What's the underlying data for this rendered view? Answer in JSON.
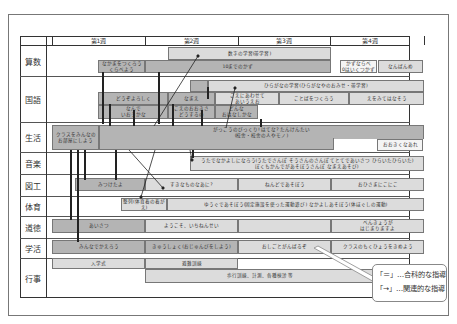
{
  "weeks": [
    "第1週",
    "第2週",
    "第3週",
    "第4週"
  ],
  "subjects": [
    "算数",
    "国語",
    "生活",
    "音楽",
    "図工",
    "体育",
    "道徳",
    "学活",
    "行事"
  ],
  "bars": {
    "sansu": {
      "kazu": "数字の学習(帯学習)",
      "narabikata": "なかまをつくろう\nくらべよう",
      "ten_made": "10までのかず",
      "kazu_narabe": "かずならべ\n0はいくつかず",
      "nanbanme": "なんばんめ"
    },
    "kokugo": {
      "hiragana": "ひらがなの学習(ひらがなやのおみせ・帯学習)",
      "douzo": "どうぞよろしく",
      "namae": "なまえ",
      "koe_ni": "こえにあわせて\nあいうえお",
      "kotoba": "ことばをつくろう",
      "e_wo_mite": "えをみてはなそう",
      "nande": "なんで\nいおうかな",
      "koe_no": "こえのおおきさ\nどうするの",
      "donna": "どんな\nおはなしかな"
    },
    "seikatsu": {
      "class_minna": "クラスをみんなの\nお部屋にしよう",
      "gakkou": "がっこうのびっくり! はてな? たんけんたい\n(校舎・校舎の人やモノ)",
      "ookiku": "おおきくなあれ"
    },
    "ongaku": {
      "uta": "うたでなかよしになろう(うたでさんぽ そうさんのさんぽ てとてであいさつ ひらいたひらいた)\nぼくもかんでがあそぼうさんぽ なまえあそび)"
    },
    "zukou": {
      "mitsuketayo": "みつけたよ",
      "sukina": "すきなものなあに?",
      "nendo": "ねんどであそぼう",
      "ohisama": "おひさまにこにこ"
    },
    "taiiku": {
      "seiretsu": "整列(体育着の着がえ)",
      "yuugu": "ゆうぐであそぼう(固定施設を使った運動遊び) なかよしあそぼう(体ほぐしの運動)"
    },
    "doutoku": {
      "aisatsu": "あいさつ",
      "youkoso": "ようこそ、いちねんせい",
      "benkyou": "べんきょうが\nはじまりますよ"
    },
    "gakkatsu": {
      "minna_de": "みんなでかえろう",
      "kyuushoku": "きゅうしょく(おじゅんびをしよう)",
      "oshigoto": "おしごとがんばるぞ",
      "class_mokuhyou": "クラスのもくひょうをきめよう"
    },
    "gyouji": {
      "nyuugakushiki": "入学式",
      "hinan": "避難訓練",
      "hokou": "歩行訓練、計測、各種検診 等"
    }
  },
  "legend": {
    "line1": "「＝」…合科的な指導",
    "line2": "「→」…関連的な指導"
  },
  "colors": {
    "dark_bar": "#b4b4b4",
    "light_bar": "#dcdcdc",
    "grid": "#333333"
  }
}
